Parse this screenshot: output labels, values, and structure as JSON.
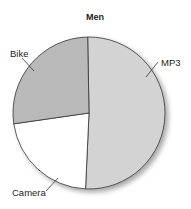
{
  "chart_data": {
    "type": "pie",
    "title": "Men",
    "categories": [
      "MP3",
      "Camera",
      "Bike"
    ],
    "values": [
      51,
      22,
      27
    ],
    "start_angle_deg": -1,
    "direction": "clockwise",
    "colors": [
      "#d3d3d3",
      "#ffffff",
      "#b9b9b9"
    ],
    "legend": "none (leader-line labels)",
    "labels": [
      {
        "text": "MP3",
        "x": 161,
        "y": 66,
        "line": [
          [
            158,
            62
          ],
          [
            146,
            77
          ]
        ]
      },
      {
        "text": "Camera",
        "x": 12,
        "y": 196,
        "line": [
          [
            46,
            191
          ],
          [
            58,
            178
          ]
        ]
      },
      {
        "text": "Bike",
        "x": 10,
        "y": 57,
        "line": [
          [
            22,
            58
          ],
          [
            34,
            71
          ]
        ]
      }
    ]
  },
  "geometry": {
    "cx": 89,
    "cy": 113,
    "r": 76
  }
}
